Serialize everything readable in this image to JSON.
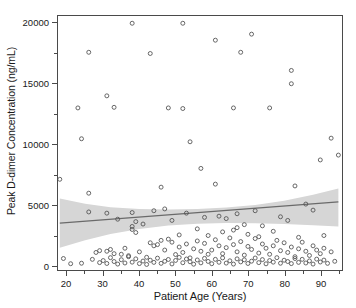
{
  "chart_data": {
    "type": "scatter",
    "title": "",
    "xlabel": "Patient Age (Years)",
    "ylabel": "Peak D-dimer Concentration (ng/mL)",
    "xlim": [
      17.5,
      96
    ],
    "ylim": [
      -400,
      20600
    ],
    "xticks": [
      20,
      30,
      40,
      50,
      60,
      70,
      80,
      90
    ],
    "xtick_labels": [
      "20",
      "30",
      "40",
      "50",
      "60",
      "70",
      "80",
      "90"
    ],
    "xminor_ticks": [
      25,
      35,
      45,
      55,
      65,
      75,
      85,
      95
    ],
    "yticks": [
      0,
      5000,
      10000,
      15000,
      20000
    ],
    "ytick_labels": [
      "0",
      "5000",
      "10000",
      "15000",
      "20000"
    ],
    "yminor_ticks": [
      2500,
      7500,
      12500,
      17500
    ],
    "grid": false,
    "legend": null,
    "marker_color": "#555555",
    "marker_size": 2.0,
    "fit_line": {
      "label": "linear regression",
      "color": "#6a6a6a",
      "x": [
        18,
        95
      ],
      "y": [
        3480,
        5230
      ]
    },
    "confidence_band": {
      "label": "95% confidence interval",
      "color": "#d6d6d6",
      "x": [
        18,
        25,
        32,
        40,
        48,
        56,
        64,
        72,
        80,
        88,
        95
      ],
      "upper": [
        5520,
        5080,
        4790,
        4640,
        4600,
        4640,
        4760,
        4980,
        5330,
        5830,
        6340
      ],
      "lower": [
        1430,
        2060,
        2570,
        2990,
        3270,
        3430,
        3490,
        3470,
        3400,
        3300,
        3190
      ]
    },
    "points": [
      [
        38,
        20000
      ],
      [
        52,
        20000
      ],
      [
        71,
        19100
      ],
      [
        61,
        18600
      ],
      [
        26,
        17600
      ],
      [
        43,
        17500
      ],
      [
        68,
        17600
      ],
      [
        82,
        16100
      ],
      [
        82,
        15000
      ],
      [
        31,
        14000
      ],
      [
        23,
        13000
      ],
      [
        33,
        13050
      ],
      [
        48,
        13000
      ],
      [
        52,
        12950
      ],
      [
        66,
        13000
      ],
      [
        76,
        13000
      ],
      [
        24,
        10450
      ],
      [
        54,
        10200
      ],
      [
        93,
        10500
      ],
      [
        18,
        7100
      ],
      [
        26,
        5950
      ],
      [
        46,
        6450
      ],
      [
        61,
        6700
      ],
      [
        83,
        6550
      ],
      [
        57,
        8000
      ],
      [
        90,
        8700
      ],
      [
        95,
        9100
      ],
      [
        31,
        4300
      ],
      [
        26,
        4400
      ],
      [
        38,
        4350
      ],
      [
        44,
        4500
      ],
      [
        47,
        4650
      ],
      [
        53,
        4300
      ],
      [
        62,
        4050
      ],
      [
        67,
        4250
      ],
      [
        72,
        4500
      ],
      [
        79,
        4000
      ],
      [
        86,
        5050
      ],
      [
        34,
        3800
      ],
      [
        39,
        3600
      ],
      [
        41,
        3400
      ],
      [
        49,
        3700
      ],
      [
        58,
        3950
      ],
      [
        64,
        3850
      ],
      [
        69,
        3350
      ],
      [
        74,
        3250
      ],
      [
        81,
        3700
      ],
      [
        88,
        4550
      ],
      [
        38,
        3200
      ],
      [
        38,
        2950
      ],
      [
        39,
        2700
      ],
      [
        51,
        2500
      ],
      [
        56,
        3000
      ],
      [
        59,
        2450
      ],
      [
        63,
        2750
      ],
      [
        66,
        2900
      ],
      [
        67,
        3100
      ],
      [
        70,
        2550
      ],
      [
        73,
        2350
      ],
      [
        77,
        2800
      ],
      [
        84,
        2300
      ],
      [
        91,
        2450
      ],
      [
        28,
        1050
      ],
      [
        29,
        1200
      ],
      [
        31,
        1150
      ],
      [
        32,
        1300
      ],
      [
        33,
        950
      ],
      [
        35,
        900
      ],
      [
        36,
        1400
      ],
      [
        37,
        780
      ],
      [
        40,
        1100
      ],
      [
        42,
        650
      ],
      [
        43,
        1850
      ],
      [
        44,
        1600
      ],
      [
        45,
        1700
      ],
      [
        46,
        2050
      ],
      [
        47,
        1250
      ],
      [
        48,
        2150
      ],
      [
        49,
        1900
      ],
      [
        50,
        880
      ],
      [
        51,
        1500
      ],
      [
        52,
        1050
      ],
      [
        53,
        1750
      ],
      [
        54,
        600
      ],
      [
        55,
        1350
      ],
      [
        56,
        2000
      ],
      [
        57,
        1150
      ],
      [
        58,
        1800
      ],
      [
        59,
        900
      ],
      [
        60,
        1250
      ],
      [
        61,
        2100
      ],
      [
        62,
        1600
      ],
      [
        63,
        950
      ],
      [
        64,
        1450
      ],
      [
        65,
        2250
      ],
      [
        66,
        1700
      ],
      [
        67,
        1100
      ],
      [
        68,
        1950
      ],
      [
        69,
        830
      ],
      [
        70,
        1550
      ],
      [
        71,
        1300
      ],
      [
        72,
        2200
      ],
      [
        73,
        1000
      ],
      [
        74,
        1750
      ],
      [
        75,
        1400
      ],
      [
        76,
        900
      ],
      [
        77,
        1600
      ],
      [
        78,
        2050
      ],
      [
        79,
        1200
      ],
      [
        80,
        1850
      ],
      [
        81,
        1050
      ],
      [
        82,
        1500
      ],
      [
        83,
        700
      ],
      [
        84,
        1350
      ],
      [
        85,
        1900
      ],
      [
        86,
        1150
      ],
      [
        87,
        800
      ],
      [
        88,
        1600
      ],
      [
        89,
        1250
      ],
      [
        90,
        950
      ],
      [
        91,
        1400
      ],
      [
        93,
        1100
      ],
      [
        19,
        550
      ],
      [
        21,
        120
      ],
      [
        24,
        160
      ],
      [
        27,
        480
      ],
      [
        29,
        210
      ],
      [
        30,
        380
      ],
      [
        31,
        140
      ],
      [
        32,
        620
      ],
      [
        33,
        300
      ],
      [
        34,
        90
      ],
      [
        35,
        450
      ],
      [
        36,
        180
      ],
      [
        37,
        700
      ],
      [
        38,
        250
      ],
      [
        39,
        520
      ],
      [
        40,
        130
      ],
      [
        41,
        340
      ],
      [
        42,
        60
      ],
      [
        43,
        410
      ],
      [
        44,
        230
      ],
      [
        45,
        580
      ],
      [
        46,
        150
      ],
      [
        47,
        320
      ],
      [
        48,
        470
      ],
      [
        49,
        100
      ],
      [
        50,
        390
      ],
      [
        51,
        640
      ],
      [
        52,
        200
      ],
      [
        53,
        510
      ],
      [
        54,
        280
      ],
      [
        55,
        80
      ],
      [
        56,
        430
      ],
      [
        57,
        190
      ],
      [
        58,
        560
      ],
      [
        59,
        310
      ],
      [
        60,
        120
      ],
      [
        61,
        480
      ],
      [
        62,
        240
      ],
      [
        63,
        600
      ],
      [
        64,
        170
      ],
      [
        65,
        360
      ],
      [
        66,
        90
      ],
      [
        67,
        520
      ],
      [
        68,
        270
      ],
      [
        69,
        440
      ],
      [
        70,
        140
      ],
      [
        71,
        330
      ],
      [
        72,
        590
      ],
      [
        73,
        210
      ],
      [
        74,
        460
      ],
      [
        75,
        110
      ],
      [
        76,
        380
      ],
      [
        77,
        250
      ],
      [
        78,
        620
      ],
      [
        79,
        160
      ],
      [
        80,
        410
      ],
      [
        81,
        300
      ],
      [
        82,
        130
      ],
      [
        83,
        550
      ],
      [
        84,
        230
      ],
      [
        85,
        480
      ],
      [
        86,
        180
      ],
      [
        87,
        350
      ],
      [
        88,
        90
      ],
      [
        89,
        500
      ],
      [
        90,
        260
      ],
      [
        91,
        420
      ],
      [
        92,
        150
      ],
      [
        94,
        320
      ]
    ]
  }
}
